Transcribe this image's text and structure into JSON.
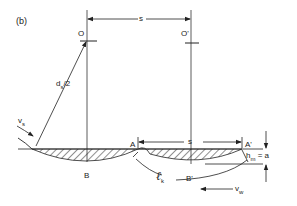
{
  "figure": {
    "panel_label": "(b)",
    "labels": {
      "spacing_top": "s",
      "spacing_bottom": "s",
      "center_1": "O",
      "center_2": "O'",
      "radius_main": "d",
      "radius_sub": "s",
      "radius_suffix": "/2",
      "wheel_velocity_main": "v",
      "wheel_velocity_sub": "s",
      "point_a": "A",
      "point_a_prime": "A'",
      "point_b": "B",
      "point_b_prime": "B'",
      "contact_length_main": "ℓ",
      "contact_length_sub": "k",
      "max_depth_main": "h",
      "max_depth_sub": "m",
      "max_depth_suffix": " = a",
      "work_velocity_main": "v",
      "work_velocity_sub": "w"
    },
    "colors": {
      "line": "#222222",
      "background": "#ffffff"
    }
  }
}
